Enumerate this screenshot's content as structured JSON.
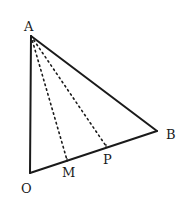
{
  "diagram": {
    "type": "geometry-triangle",
    "background": "#ffffff",
    "stroke_color": "#1a1a1a",
    "points": {
      "A": {
        "label": "A",
        "x": 31,
        "y": 36,
        "label_x": 24,
        "label_y": 31
      },
      "O": {
        "label": "O",
        "x": 30,
        "y": 173,
        "label_x": 21,
        "label_y": 193
      },
      "B": {
        "label": "B",
        "x": 157,
        "y": 131,
        "label_x": 166,
        "label_y": 139
      },
      "M": {
        "label": "M",
        "x": 67,
        "y": 160,
        "label_x": 62,
        "label_y": 177
      },
      "P": {
        "label": "P",
        "x": 106,
        "y": 146,
        "label_x": 103,
        "label_y": 164
      }
    },
    "solid_segments": [
      {
        "from": "A",
        "to": "O"
      },
      {
        "from": "O",
        "to": "B"
      },
      {
        "from": "A",
        "to": "B"
      }
    ],
    "dashed_segments": [
      {
        "from": "A",
        "to": "M"
      },
      {
        "from": "A",
        "to": "P"
      }
    ]
  }
}
